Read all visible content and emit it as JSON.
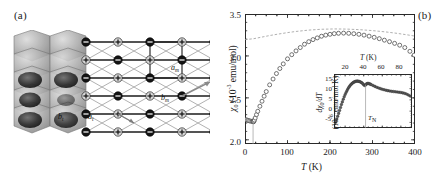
{
  "figure": {
    "panel_a": {
      "label": "(a)",
      "description": "crystal-structure-and-triangular-lattice",
      "vectors": [
        {
          "name": "a-monoclinic",
          "base": "a",
          "sub": "m"
        },
        {
          "name": "b-monoclinic",
          "base": "b",
          "sub": "m"
        },
        {
          "name": "b-triangular",
          "base": "b",
          "sub": "t"
        },
        {
          "name": "a-triangular",
          "base": "a",
          "sub": "t"
        }
      ]
    },
    "panel_b": {
      "label": "(b)"
    }
  },
  "chart_data": [
    {
      "id": "main",
      "type": "scatter",
      "title": "",
      "xlabel": "T (K)",
      "ylabel": "chi_0 (10^-3 emu/mol)",
      "ylabel_base": "χ",
      "ylabel_sub": "0",
      "ylabel_unit_pre": " (10",
      "ylabel_exp": "-3",
      "ylabel_unit_post": " emu/mol)",
      "xlabel_base": "T",
      "xlabel_unit": " (K)",
      "xlim": [
        0,
        400
      ],
      "ylim": [
        1.95,
        3.5
      ],
      "xticks": [
        0,
        100,
        200,
        300,
        400
      ],
      "yticks": [
        2.0,
        2.5,
        3.0,
        3.5
      ],
      "grid": false,
      "legend": "none",
      "series": [
        {
          "name": "chi0-measured",
          "style": "open-circles",
          "x": [
            2,
            5,
            8,
            11,
            14,
            17,
            19,
            20,
            21,
            22,
            24,
            27,
            30,
            35,
            40,
            45,
            50,
            58,
            66,
            74,
            82,
            90,
            100,
            110,
            120,
            130,
            140,
            150,
            160,
            170,
            180,
            190,
            200,
            210,
            220,
            232,
            244,
            256,
            268,
            280,
            292,
            304,
            316,
            328,
            340,
            352,
            364,
            376,
            388,
            398
          ],
          "y": [
            2.24,
            2.235,
            2.23,
            2.225,
            2.222,
            2.22,
            2.218,
            2.215,
            2.222,
            2.235,
            2.26,
            2.3,
            2.34,
            2.4,
            2.46,
            2.52,
            2.575,
            2.655,
            2.725,
            2.79,
            2.85,
            2.905,
            2.965,
            3.015,
            3.06,
            3.1,
            3.14,
            3.17,
            3.195,
            3.215,
            3.235,
            3.248,
            3.258,
            3.266,
            3.27,
            3.272,
            3.27,
            3.265,
            3.258,
            3.248,
            3.236,
            3.222,
            3.206,
            3.188,
            3.17,
            3.15,
            3.128,
            3.1,
            3.055,
            3.01
          ]
        },
        {
          "name": "chi0-fit-dashed",
          "style": "dashed-line",
          "x": [
            0,
            20,
            40,
            60,
            80,
            100,
            120,
            150,
            180,
            210,
            240,
            270,
            300,
            330,
            360,
            390,
            400
          ],
          "y": [
            3.195,
            3.205,
            3.225,
            3.245,
            3.262,
            3.278,
            3.292,
            3.308,
            3.318,
            3.322,
            3.32,
            3.313,
            3.302,
            3.287,
            3.268,
            3.245,
            3.236
          ]
        },
        {
          "name": "transition-marker-line",
          "style": "vertical-line",
          "x": [
            19
          ],
          "y_from": 1.95,
          "y_to": 2.218
        }
      ]
    },
    {
      "id": "inset",
      "type": "scatter",
      "title": "",
      "xlabel": "T (K)",
      "ylabel": "dchi_0/dT (10^-6 emu/mol K)",
      "ylabel_line1_d": "d",
      "ylabel_line1_chi": "χ",
      "ylabel_line1_sub": "0",
      "ylabel_line1_slash": "/d",
      "ylabel_line1_T": "T",
      "ylabel_line2_pre": "(10",
      "ylabel_line2_exp": "-6",
      "ylabel_line2_post": " emu/mol K)",
      "xlabel_base": "T",
      "xlabel_unit": " (K)",
      "xaxis_position": "top",
      "xlim": [
        8,
        92
      ],
      "ylim": [
        -7.5,
        16.5
      ],
      "xticks": [
        20,
        40,
        60,
        80
      ],
      "yticks": [
        -5,
        0,
        5,
        10,
        15
      ],
      "grid": false,
      "legend": "none",
      "annotations": [
        {
          "name": "TN-marker",
          "base": "T",
          "sub": "N",
          "x": 42
        }
      ],
      "series": [
        {
          "name": "dchi0-dT",
          "style": "filled-circles",
          "x": [
            9,
            10,
            11,
            12,
            13,
            14,
            15,
            16,
            17,
            18,
            19,
            20,
            21,
            22,
            23,
            24,
            25,
            26,
            27,
            28,
            29,
            30,
            31,
            32,
            33,
            34,
            35,
            36,
            37,
            38,
            39,
            40,
            41,
            42,
            43,
            44,
            45,
            46,
            47,
            48,
            50,
            52,
            54,
            56,
            58,
            60,
            62,
            64,
            66,
            68,
            70,
            72,
            74,
            76,
            78,
            80,
            82,
            84,
            86,
            88,
            90
          ],
          "y": [
            -5.5,
            -4.6,
            -3.5,
            -2.3,
            -1.0,
            0.3,
            1.6,
            2.9,
            4.1,
            5.3,
            6.4,
            7.4,
            8.3,
            9.1,
            9.9,
            10.6,
            11.2,
            11.7,
            12.1,
            12.5,
            12.8,
            13.0,
            13.2,
            13.3,
            13.35,
            13.3,
            13.2,
            13.05,
            12.85,
            12.6,
            12.2,
            11.7,
            11.4,
            11.6,
            12.1,
            12.3,
            12.3,
            12.2,
            12.0,
            11.8,
            11.4,
            11.0,
            10.6,
            10.3,
            10.0,
            9.7,
            9.5,
            9.3,
            9.1,
            8.95,
            8.8,
            8.7,
            8.6,
            8.5,
            8.4,
            8.3,
            8.1,
            7.9,
            7.6,
            7.2,
            6.7
          ]
        },
        {
          "name": "TN-vertical-line",
          "style": "vertical-line",
          "x": [
            42
          ],
          "y_from": -7.5,
          "y_to": 11.8
        }
      ]
    }
  ]
}
